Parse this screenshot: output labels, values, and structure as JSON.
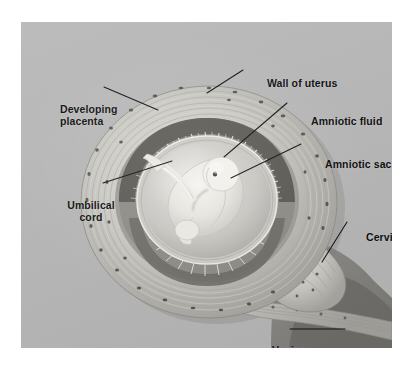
{
  "figure": {
    "type": "anatomical-illustration",
    "panel": {
      "background_color": "#b8b8b8",
      "border_color": "#ffffff"
    }
  },
  "labels": [
    {
      "id": "wall-of-uterus",
      "text": "Wall of uterus",
      "lines": [
        "Wall of uterus"
      ],
      "align": "left",
      "x": 246,
      "y": 55,
      "leader": {
        "from": [
          243,
          70
        ],
        "to": [
          207,
          93
        ]
      }
    },
    {
      "id": "developing-placenta",
      "text": "Developing placenta",
      "lines": [
        "Developing",
        "placenta"
      ],
      "align": "left",
      "x": 39,
      "y": 81,
      "leader": {
        "from": [
          104,
          87
        ],
        "to": [
          158,
          110
        ]
      }
    },
    {
      "id": "amniotic-fluid",
      "text": "Amniotic fluid",
      "lines": [
        "Amniotic fluid"
      ],
      "align": "left",
      "x": 290,
      "y": 93,
      "leader": {
        "from": [
          287,
          103
        ],
        "to": [
          224,
          157
        ]
      }
    },
    {
      "id": "amniotic-sac",
      "text": "Amniotic sac",
      "lines": [
        "Amniotic sac"
      ],
      "align": "left",
      "x": 304,
      "y": 136,
      "leader": {
        "from": [
          301,
          144
        ],
        "to": [
          231,
          178
        ]
      }
    },
    {
      "id": "umbilical-cord",
      "text": "Umbilical cord",
      "lines": [
        "Umbilical",
        "cord"
      ],
      "align": "center",
      "x": 38,
      "y": 177,
      "leader": {
        "from": [
          103,
          183
        ],
        "to": [
          172,
          161
        ]
      }
    },
    {
      "id": "cervix",
      "text": "Cervix",
      "lines": [
        "Cervix"
      ],
      "align": "left",
      "x": 345,
      "y": 209,
      "leader": {
        "from": [
          347,
          222
        ],
        "to": [
          322,
          262
        ]
      }
    },
    {
      "id": "vagina",
      "text": "Vagina",
      "lines": [
        "Vagina"
      ],
      "align": "left",
      "x": 251,
      "y": 322,
      "leader": {
        "from": [
          290,
          329
        ],
        "to": [
          345,
          329
        ]
      }
    }
  ],
  "colors": {
    "panel_background": "#b8b8b8",
    "label_text": "#0b0b0b",
    "leader_line": "#101010",
    "uterus_wall_light": "#d9d9d6",
    "uterus_wall_mid": "#bdbcb6",
    "placenta_dark": "#5c5b57",
    "amniotic_fluid": "#cfcfca",
    "fetus_pale": "#f2f1ec",
    "shadow": "#8e8d89",
    "cavity_dark": "#6f6e6a"
  },
  "structures": [
    {
      "name": "uterus-wall",
      "description": "concentric striated muscular bands with dark vessel speckles"
    },
    {
      "name": "developing-placenta",
      "description": "dark crescent of villi segments along upper inner uterine wall"
    },
    {
      "name": "amniotic-sac",
      "description": "thin membrane ring enclosing the fluid-filled cavity"
    },
    {
      "name": "amniotic-fluid",
      "description": "pale fluid filling the sac around the fetus"
    },
    {
      "name": "fetus",
      "description": "curled fetus in profile, head upper right"
    },
    {
      "name": "umbilical-cord",
      "description": "cord running from placenta to fetal abdomen"
    },
    {
      "name": "cervix",
      "description": "narrowed neck at lower right of uterus"
    },
    {
      "name": "vagina",
      "description": "canal extending down and right from the cervix"
    }
  ]
}
